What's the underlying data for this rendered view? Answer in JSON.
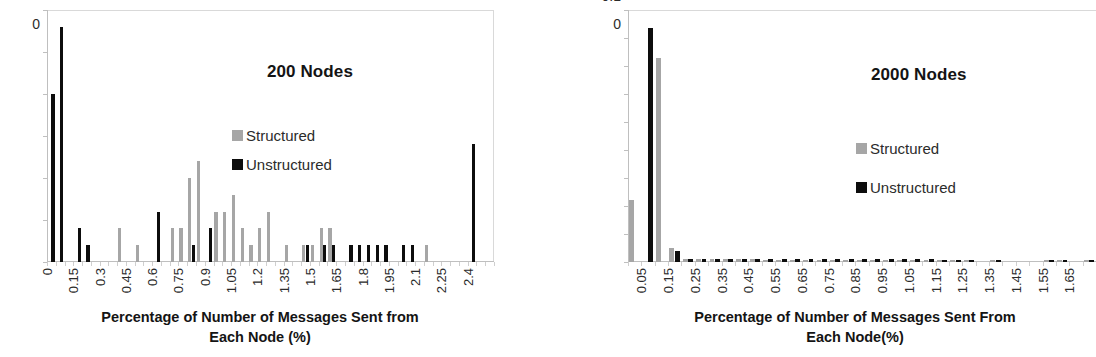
{
  "figure": {
    "panels": [
      "left",
      "right"
    ]
  },
  "chart_data": [
    {
      "id": "chart-200-nodes",
      "type": "bar",
      "title": "200 Nodes",
      "xlabel_line1": "Percentage of Number of Messages Sent from",
      "xlabel_line2": "Each Node (%)",
      "ylabel": "",
      "ylim": [
        0,
        0.3
      ],
      "ytick_labels": [
        "0.3",
        "0.25",
        "0.2",
        "0.15",
        "0.1",
        "0.05",
        "0"
      ],
      "ytick_values": [
        0.3,
        0.25,
        0.2,
        0.15,
        0.1,
        0.05,
        0
      ],
      "grid": false,
      "legend_position": "inside-right",
      "legend": [
        "Structured",
        "Unstructured"
      ],
      "colors": {
        "Structured": "#a6a6a6",
        "Unstructured": "#0d0d0d"
      },
      "xtick_labels": [
        "0",
        "0.15",
        "0.3",
        "0.45",
        "0.6",
        "0.75",
        "0.9",
        "1.05",
        "1.2",
        "1.35",
        "1.5",
        "1.65",
        "1.8",
        "1.95",
        "2.1",
        "2.25",
        "2.4"
      ],
      "xtick_values": [
        0,
        0.15,
        0.3,
        0.45,
        0.6,
        0.75,
        0.9,
        1.05,
        1.2,
        1.35,
        1.5,
        1.65,
        1.8,
        1.95,
        2.1,
        2.25,
        2.4
      ],
      "bin_step": 0.05,
      "x": [
        0,
        0.05,
        0.1,
        0.15,
        0.2,
        0.25,
        0.3,
        0.35,
        0.4,
        0.45,
        0.5,
        0.55,
        0.6,
        0.65,
        0.7,
        0.75,
        0.8,
        0.85,
        0.9,
        0.95,
        1.0,
        1.05,
        1.1,
        1.15,
        1.2,
        1.25,
        1.3,
        1.35,
        1.4,
        1.45,
        1.5,
        1.55,
        1.6,
        1.65,
        1.7,
        1.75,
        1.8,
        1.85,
        1.9,
        1.95,
        2.0,
        2.05,
        2.1,
        2.15,
        2.2,
        2.25,
        2.3,
        2.35,
        2.4,
        2.45,
        2.5
      ],
      "series": [
        {
          "name": "Structured",
          "values": [
            0,
            0,
            0,
            0,
            0,
            0,
            0,
            0,
            0.04,
            0,
            0.02,
            0,
            0,
            0,
            0.04,
            0.04,
            0.1,
            0.12,
            0,
            0.06,
            0.06,
            0.08,
            0.04,
            0.02,
            0.04,
            0.06,
            0,
            0.02,
            0,
            0.02,
            0.02,
            0.04,
            0.04,
            0,
            0,
            0,
            0,
            0,
            0,
            0,
            0,
            0,
            0,
            0.02,
            0,
            0,
            0,
            0,
            0,
            0,
            0
          ]
        },
        {
          "name": "Unstructured",
          "values": [
            0.2,
            0.28,
            0,
            0.04,
            0.02,
            0,
            0,
            0,
            0,
            0,
            0,
            0,
            0.06,
            0,
            0,
            0,
            0.02,
            0,
            0.04,
            0,
            0,
            0,
            0,
            0,
            0,
            0,
            0,
            0,
            0,
            0.02,
            0,
            0.02,
            0.02,
            0,
            0.02,
            0.02,
            0.02,
            0.02,
            0.02,
            0,
            0.02,
            0.02,
            0,
            0,
            0,
            0,
            0,
            0,
            0.14,
            0,
            0
          ]
        }
      ]
    },
    {
      "id": "chart-2000-nodes",
      "type": "bar",
      "title": "2000 Nodes",
      "xlabel_line1": "Percentage of Number of Messages Sent From",
      "xlabel_line2": "Each Node(%)",
      "ylabel": "",
      "ylim": [
        0,
        0.9
      ],
      "ytick_labels": [
        "0.9",
        "0.8",
        "0.7",
        "0.6",
        "0.5",
        "0.4",
        "0.3",
        "0.2",
        "0.1",
        "0"
      ],
      "ytick_values": [
        0.9,
        0.8,
        0.7,
        0.6,
        0.5,
        0.4,
        0.3,
        0.2,
        0.1,
        0
      ],
      "grid": false,
      "legend_position": "inside-right",
      "legend": [
        "Structured",
        "Unstructured"
      ],
      "colors": {
        "Structured": "#a6a6a6",
        "Unstructured": "#0d0d0d"
      },
      "xtick_labels": [
        "0.05",
        "0.15",
        "0.25",
        "0.35",
        "0.45",
        "0.55",
        "0.65",
        "0.75",
        "0.85",
        "0.95",
        "1.05",
        "1.15",
        "1.25",
        "1.35",
        "1.45",
        "1.55",
        "1.65"
      ],
      "xtick_values": [
        0.05,
        0.15,
        0.25,
        0.35,
        0.45,
        0.55,
        0.65,
        0.75,
        0.85,
        0.95,
        1.05,
        1.15,
        1.25,
        1.35,
        1.45,
        1.55,
        1.65
      ],
      "bin_step": 0.05,
      "x": [
        0.0,
        0.05,
        0.1,
        0.15,
        0.2,
        0.25,
        0.3,
        0.35,
        0.4,
        0.45,
        0.5,
        0.55,
        0.6,
        0.65,
        0.7,
        0.75,
        0.8,
        0.85,
        0.9,
        0.95,
        1.0,
        1.05,
        1.1,
        1.15,
        1.2,
        1.25,
        1.3,
        1.35,
        1.4,
        1.45,
        1.5,
        1.55,
        1.6,
        1.65,
        1.7
      ],
      "series": [
        {
          "name": "Structured",
          "values": [
            0.22,
            0,
            0.73,
            0.05,
            0.012,
            0.01,
            0.01,
            0.01,
            0.01,
            0.01,
            0.008,
            0.008,
            0.008,
            0.008,
            0.008,
            0.008,
            0.008,
            0.008,
            0.008,
            0.008,
            0.008,
            0.008,
            0.008,
            0.006,
            0.006,
            0.006,
            0,
            0.006,
            0,
            0,
            0,
            0.006,
            0.006,
            0,
            0.006
          ]
        },
        {
          "name": "Unstructured",
          "values": [
            0,
            0.835,
            0,
            0.038,
            0.012,
            0.012,
            0.012,
            0.012,
            0.012,
            0.012,
            0.01,
            0.01,
            0.01,
            0.01,
            0.01,
            0.01,
            0.01,
            0.01,
            0.01,
            0.01,
            0.01,
            0.01,
            0.01,
            0.008,
            0.008,
            0.008,
            0,
            0.008,
            0,
            0,
            0,
            0.008,
            0.008,
            0,
            0.008
          ]
        }
      ]
    }
  ]
}
